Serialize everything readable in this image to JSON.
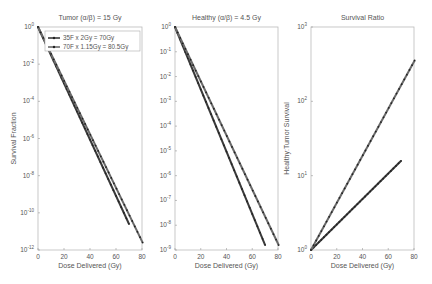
{
  "chart_data": [
    {
      "type": "line",
      "title": "Tumor (α/β) = 15 Gy",
      "xlabel": "Dose Delivered (Gy)",
      "ylabel": "Survival Fraction",
      "yscale": "log",
      "xlim": [
        0,
        80
      ],
      "ylim_exp": [
        -12,
        0
      ],
      "xticks": [
        "0",
        "20",
        "40",
        "60",
        "80"
      ],
      "yticks": [
        "10^0",
        "10^-2",
        "10^-4",
        "10^-6",
        "10^-8",
        "10^-10",
        "10^-12"
      ],
      "legend": [
        "35F x 2Gy = 70Gy",
        "70F x 1.15Gy = 80.5Gy"
      ],
      "series": [
        {
          "name": "35F x 2Gy = 70Gy",
          "x": [
            0,
            70
          ],
          "log10y": [
            0,
            -10.6
          ]
        },
        {
          "name": "70F x 1.15Gy = 80.5Gy",
          "x": [
            0,
            80.5
          ],
          "log10y": [
            0,
            -11.6
          ]
        }
      ]
    },
    {
      "type": "line",
      "title": "Healthy (α/β) = 4.5 Gy",
      "xlabel": "Dose Delivered (Gy)",
      "ylabel": "",
      "yscale": "log",
      "xlim": [
        0,
        80
      ],
      "ylim_exp": [
        -9,
        0
      ],
      "xticks": [
        "0",
        "20",
        "40",
        "60",
        "80"
      ],
      "yticks": [
        "10^0",
        "10^-1",
        "10^-2",
        "10^-3",
        "10^-4",
        "10^-5",
        "10^-6",
        "10^-7",
        "10^-8",
        "10^-9"
      ],
      "series": [
        {
          "name": "35F x 2Gy = 70Gy",
          "x": [
            0,
            70
          ],
          "log10y": [
            0,
            -8.8
          ]
        },
        {
          "name": "70F x 1.15Gy = 80.5Gy",
          "x": [
            0,
            80.5
          ],
          "log10y": [
            0,
            -8.8
          ]
        }
      ]
    },
    {
      "type": "line",
      "title": "Survival Ratio",
      "xlabel": "Dose Delivered (Gy)",
      "ylabel": "Healthy:Tumor Survival",
      "yscale": "log",
      "xlim": [
        0,
        80
      ],
      "ylim_exp": [
        0,
        3
      ],
      "xticks": [
        "0",
        "20",
        "40",
        "60",
        "80"
      ],
      "yticks": [
        "10^0",
        "10^1",
        "10^2",
        "10^3"
      ],
      "series": [
        {
          "name": "35F x 2Gy = 70Gy",
          "x": [
            0,
            70
          ],
          "log10y": [
            0,
            1.2
          ]
        },
        {
          "name": "70F x 1.15Gy = 80.5Gy",
          "x": [
            0,
            80.5
          ],
          "log10y": [
            0,
            2.55
          ]
        }
      ]
    }
  ]
}
